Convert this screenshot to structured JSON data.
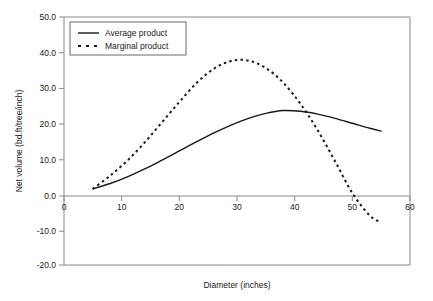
{
  "chart_data": {
    "type": "line",
    "title": "",
    "xlabel": "Diameter (inches)",
    "ylabel": "Net volume (bd.ft/tree/inch)",
    "xlim": [
      0,
      60
    ],
    "ylim": [
      -20.0,
      50.0
    ],
    "xticks": [
      0,
      10,
      20,
      30,
      40,
      50,
      60
    ],
    "xtick_labels": [
      "0",
      "10",
      "20",
      "30",
      "40",
      "50",
      "60"
    ],
    "yticks": [
      -20.0,
      -10.0,
      0.0,
      10.0,
      20.0,
      30.0,
      40.0,
      50.0
    ],
    "ytick_labels": [
      "-20.0",
      "-10.0",
      "0.0",
      "10.0",
      "20.0",
      "30.0",
      "40.0",
      "50.0"
    ],
    "grid": false,
    "legend_position": "upper left",
    "zero_line": true,
    "series": [
      {
        "name": "Average product",
        "style": "solid",
        "color": "#1a1a1a",
        "x": [
          5,
          8,
          11,
          14,
          17,
          20,
          23,
          26,
          29,
          32,
          35,
          38,
          41,
          44,
          47,
          50,
          53,
          55
        ],
        "y": [
          1.5,
          3.0,
          4.9,
          7.1,
          9.6,
          12.2,
          14.8,
          17.3,
          19.5,
          21.4,
          22.8,
          23.6,
          23.4,
          22.6,
          21.4,
          20.0,
          18.6,
          17.8
        ]
      },
      {
        "name": "Marginal product",
        "style": "dashed",
        "color": "#1a1a1a",
        "x": [
          5,
          8,
          11,
          14,
          17,
          20,
          23,
          26,
          29,
          32,
          35,
          38,
          41,
          44,
          47,
          50,
          53,
          55
        ],
        "y": [
          1.5,
          5.2,
          9.5,
          14.6,
          20.3,
          26.0,
          31.4,
          35.4,
          37.6,
          37.7,
          35.6,
          31.5,
          25.5,
          18.0,
          9.3,
          0.3,
          -6.0,
          -8.0
        ]
      }
    ],
    "annotations": {
      "marginal_peak": {
        "x": 29.5,
        "y": 37.8
      },
      "average_peak": {
        "x": 38,
        "y": 23.6
      },
      "crossover": {
        "x": 41,
        "y": 23.4
      },
      "marginal_zero_crossing": {
        "x": 51,
        "y": 0.0
      }
    }
  },
  "legend": {
    "items": [
      {
        "label": "Average product",
        "style": "solid"
      },
      {
        "label": "Marginal product",
        "style": "dashed"
      }
    ]
  }
}
